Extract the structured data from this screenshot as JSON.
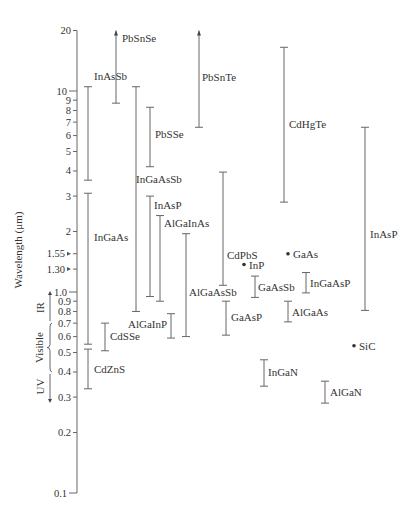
{
  "chart_data": {
    "type": "range",
    "title": "",
    "ylabel": "Wavelength (μm)",
    "yscale": "log",
    "ylim": [
      0.1,
      20
    ],
    "yticks": [
      {
        "value": 20,
        "label": "20"
      },
      {
        "value": 10,
        "label": "10"
      },
      {
        "value": 9,
        "label": "9"
      },
      {
        "value": 8,
        "label": "8"
      },
      {
        "value": 7,
        "label": "7"
      },
      {
        "value": 6,
        "label": "6"
      },
      {
        "value": 5,
        "label": "5"
      },
      {
        "value": 4,
        "label": "4"
      },
      {
        "value": 3,
        "label": "3"
      },
      {
        "value": 2,
        "label": "2"
      },
      {
        "value": 1.55,
        "label": "1.55",
        "arrow": true
      },
      {
        "value": 1.3,
        "label": "1.30",
        "arrow": true
      },
      {
        "value": 1.0,
        "label": "1.0"
      },
      {
        "value": 0.9,
        "label": "0.9"
      },
      {
        "value": 0.8,
        "label": "0.8"
      },
      {
        "value": 0.7,
        "label": "0.7"
      },
      {
        "value": 0.6,
        "label": "0.6"
      },
      {
        "value": 0.5,
        "label": "0.5"
      },
      {
        "value": 0.4,
        "label": "0.4"
      },
      {
        "value": 0.3,
        "label": "0.3"
      },
      {
        "value": 0.2,
        "label": "0.2"
      },
      {
        "value": 0.1,
        "label": "0.1"
      }
    ],
    "regions": [
      {
        "name": "IR",
        "from": 0.7,
        "to": 1.0
      },
      {
        "name": "Visible",
        "from": 0.4,
        "to": 0.7
      },
      {
        "name": "UV",
        "from": 0.3,
        "to": 0.4
      }
    ],
    "series": [
      {
        "name": "InAsSb",
        "min": 3.6,
        "max": 10.5,
        "x": 88,
        "label_dx": 6,
        "label_y": 0.5
      },
      {
        "name": "InGaAs",
        "min": 0.55,
        "max": 3.1,
        "x": 88,
        "label_dx": 6,
        "label_y": 0.5
      },
      {
        "name": "CdZnS",
        "min": 0.33,
        "max": 0.52,
        "x": 88,
        "label_dx": 6,
        "label_y": 0.75
      },
      {
        "name": "PbSnSe",
        "min": 8.7,
        "max": 20,
        "open_top": true,
        "x": 116,
        "label_dx": 6
      },
      {
        "name": "InGaAsSb",
        "min": 0.8,
        "max": 10.5,
        "x": 136,
        "label_dx": 4
      },
      {
        "name": "PbSSe",
        "min": 4.2,
        "max": 8.3,
        "x": 150,
        "label_dx": 6
      },
      {
        "name": "CdSSe",
        "min": 0.51,
        "max": 0.7,
        "x": 105,
        "label_dx": 6
      },
      {
        "name": "InAsP",
        "min": 0.95,
        "max": 3.0,
        "x": 150,
        "label_dx": 4
      },
      {
        "name": "AlGaInAs",
        "min": 0.9,
        "max": 2.4,
        "x": 160,
        "label_dx": 6
      },
      {
        "name": "AlGaInP",
        "min": 0.59,
        "max": 0.78,
        "x": 171,
        "label_side": "left"
      },
      {
        "name": "AlGaAsSb",
        "min": 0.6,
        "max": 1.95,
        "x": 186,
        "label_text_only": true
      },
      {
        "name": "PbSnTe",
        "min": 6.6,
        "max": 20,
        "open_top": true,
        "x": 199,
        "label_dx": 4
      },
      {
        "name": "CdPbS",
        "min": 1.08,
        "max": 3.95,
        "x": 223,
        "label_dx": 6
      },
      {
        "name": "GaAsP",
        "min": 0.61,
        "max": 0.9,
        "x": 226,
        "label_dx": 6
      },
      {
        "name": "GaAsSb",
        "min": 0.94,
        "max": 1.2,
        "x": 255,
        "label_dx": 4
      },
      {
        "name": "InGaN",
        "min": 0.34,
        "max": 0.46,
        "x": 264,
        "label_dx": 4
      },
      {
        "name": "CdHgTe",
        "min": 2.8,
        "max": 16.5,
        "x": 284,
        "label_dx": 5
      },
      {
        "name": "AlGaAs",
        "min": 0.71,
        "max": 0.9,
        "x": 288,
        "label_dx": 4
      },
      {
        "name": "InGaAsP",
        "min": 0.99,
        "max": 1.25,
        "x": 306,
        "label_dx": 3
      },
      {
        "name": "AlGaN",
        "min": 0.28,
        "max": 0.36,
        "x": 325,
        "label_dx": 5
      },
      {
        "name": "InAsP",
        "min": 0.81,
        "max": 6.6,
        "x": 365,
        "label_dx": 6
      }
    ],
    "points": [
      {
        "name": "InP",
        "value": 1.37,
        "x": 244
      },
      {
        "name": "GaAs",
        "value": 1.55,
        "x": 288
      },
      {
        "name": "SiC",
        "value": 0.54,
        "x": 354
      }
    ],
    "grid": false,
    "legend": "none"
  }
}
